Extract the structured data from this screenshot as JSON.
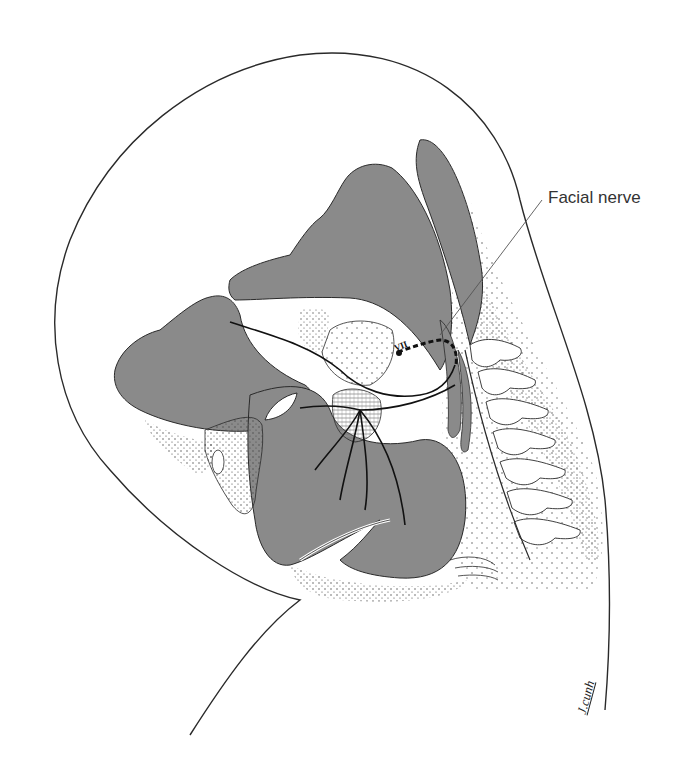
{
  "figure": {
    "colors": {
      "fill_gray": "#8a8a8a",
      "outline": "#2a2a2a",
      "stipple": "#555555",
      "background": "#ffffff"
    }
  },
  "labels": {
    "facial_nerve": "Facial nerve",
    "nerve_numeral": "VII"
  },
  "signature": "J.cunh"
}
